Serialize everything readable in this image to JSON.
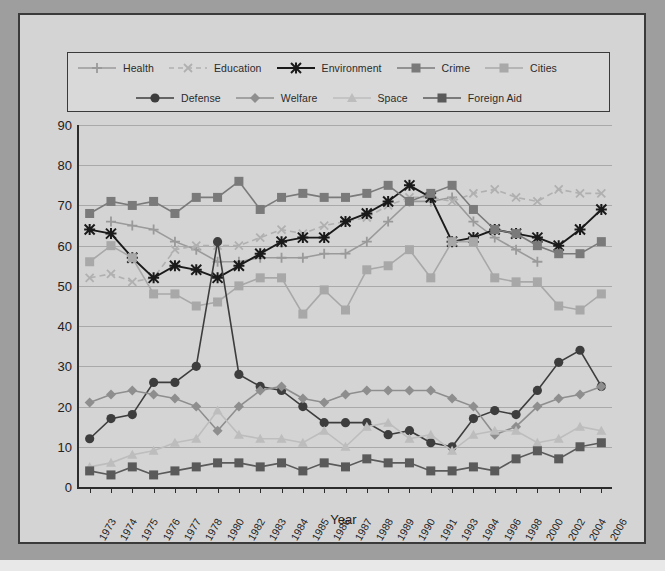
{
  "chart_data": {
    "type": "line",
    "title": "",
    "xlabel": "Year",
    "ylabel": "",
    "ylim": [
      0,
      90
    ],
    "yticks": [
      0,
      10,
      20,
      30,
      40,
      50,
      60,
      70,
      80,
      90
    ],
    "grid": true,
    "legend_position": "top",
    "categories": [
      "1973",
      "1974",
      "1975",
      "1976",
      "1977",
      "1978",
      "1980",
      "1982",
      "1983",
      "1984",
      "1985",
      "1986",
      "1987",
      "1988",
      "1989",
      "1990",
      "1991",
      "1993",
      "1994",
      "1996",
      "1998",
      "2000",
      "2002",
      "2004",
      "2006"
    ],
    "series": [
      {
        "name": "Health",
        "color": "#9a9a9a",
        "marker": "plus",
        "dash": "solid",
        "values": [
          null,
          66,
          65,
          64,
          61,
          59,
          56,
          56,
          57,
          57,
          57,
          58,
          58,
          61,
          66,
          71,
          71,
          72,
          66,
          62,
          59,
          56,
          null,
          null,
          null
        ]
      },
      {
        "name": "Education",
        "color": "#b0b0b0",
        "marker": "x",
        "dash": "dashed",
        "values": [
          52,
          53,
          51,
          52,
          59,
          60,
          60,
          60,
          62,
          64,
          63,
          65,
          66,
          67,
          70,
          72,
          72,
          71,
          73,
          74,
          72,
          71,
          74,
          73,
          73
        ]
      },
      {
        "name": "Environment",
        "color": "#1a1a1a",
        "marker": "star",
        "dash": "solid",
        "values": [
          64,
          63,
          57,
          52,
          55,
          54,
          52,
          55,
          58,
          61,
          62,
          62,
          66,
          68,
          71,
          75,
          72,
          61,
          62,
          64,
          63,
          62,
          60,
          64,
          69
        ]
      },
      {
        "name": "Crime",
        "color": "#7a7a7a",
        "marker": "square",
        "dash": "solid",
        "values": [
          68,
          71,
          70,
          71,
          68,
          72,
          72,
          76,
          69,
          72,
          73,
          72,
          72,
          73,
          75,
          71,
          73,
          75,
          69,
          64,
          63,
          60,
          58,
          58,
          61
        ]
      },
      {
        "name": "Cities",
        "color": "#a8a8a8",
        "marker": "square",
        "dash": "solid",
        "values": [
          56,
          60,
          57,
          48,
          48,
          45,
          46,
          50,
          52,
          52,
          43,
          49,
          44,
          54,
          55,
          59,
          52,
          61,
          61,
          52,
          51,
          51,
          45,
          44,
          48
        ]
      },
      {
        "name": "Defense",
        "color": "#3d3d3d",
        "marker": "circle",
        "dash": "solid",
        "values": [
          12,
          17,
          18,
          26,
          26,
          30,
          61,
          28,
          25,
          24,
          20,
          16,
          16,
          16,
          13,
          14,
          11,
          10,
          17,
          19,
          18,
          24,
          31,
          34,
          25
        ]
      },
      {
        "name": "Welfare",
        "color": "#8e8e8e",
        "marker": "diamond",
        "dash": "solid",
        "values": [
          21,
          23,
          24,
          23,
          22,
          20,
          14,
          20,
          24,
          25,
          22,
          21,
          23,
          24,
          24,
          24,
          24,
          22,
          20,
          13,
          15,
          20,
          22,
          23,
          25
        ]
      },
      {
        "name": "Space",
        "color": "#bdbdbd",
        "marker": "triangle",
        "dash": "solid",
        "values": [
          5,
          6,
          8,
          9,
          11,
          12,
          19,
          13,
          12,
          12,
          11,
          14,
          10,
          15,
          16,
          12,
          13,
          9,
          13,
          14,
          14,
          11,
          12,
          15,
          14
        ]
      },
      {
        "name": "Foreign Aid",
        "color": "#5a5a5a",
        "marker": "square",
        "dash": "solid",
        "values": [
          4,
          3,
          5,
          3,
          4,
          5,
          6,
          6,
          5,
          6,
          4,
          6,
          5,
          7,
          6,
          6,
          4,
          4,
          5,
          4,
          7,
          9,
          7,
          10,
          11
        ]
      }
    ]
  },
  "legend": {
    "row1": [
      "Health",
      "Education",
      "Environment",
      "Crime",
      "Cities"
    ],
    "row2": [
      "Defense",
      "Welfare",
      "Space",
      "Foreign Aid"
    ]
  },
  "axis": {
    "x_title": "Year"
  }
}
